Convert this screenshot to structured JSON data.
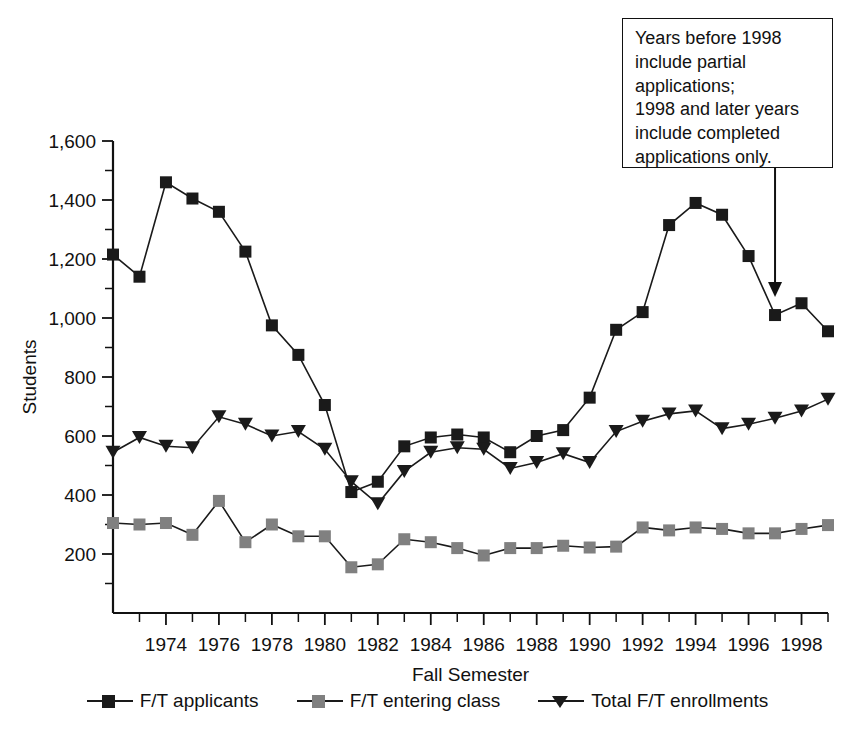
{
  "chart_data": {
    "type": "line",
    "title": "",
    "xlabel": "Fall Semester",
    "ylabel": "Students",
    "xlim": [
      1972,
      1999
    ],
    "ylim": [
      0,
      1600
    ],
    "ytick_values": [
      200,
      400,
      600,
      800,
      1000,
      1200,
      1400,
      1600
    ],
    "ytick_labels": [
      "200",
      "400",
      "600",
      "800",
      "1,000",
      "1,200",
      "1,400",
      "1,600"
    ],
    "yminor_step": 100,
    "xtick_values": [
      1974,
      1976,
      1978,
      1980,
      1982,
      1984,
      1986,
      1988,
      1990,
      1992,
      1994,
      1996,
      1998
    ],
    "xtick_labels": [
      "1974",
      "1976",
      "1978",
      "1980",
      "1982",
      "1984",
      "1986",
      "1988",
      "1990",
      "1992",
      "1994",
      "1996",
      "1998"
    ],
    "xminor_step": 1,
    "grid": false,
    "legend_position": "bottom",
    "x": [
      1972,
      1973,
      1974,
      1975,
      1976,
      1977,
      1978,
      1979,
      1980,
      1981,
      1982,
      1983,
      1984,
      1985,
      1986,
      1987,
      1988,
      1989,
      1990,
      1991,
      1992,
      1993,
      1994,
      1995,
      1996,
      1997,
      1998,
      1999
    ],
    "series": [
      {
        "name": "F/T applicants",
        "marker": "square",
        "color": "#1a1a1a",
        "values": [
          1215,
          1140,
          1460,
          1405,
          1360,
          1225,
          975,
          875,
          705,
          410,
          445,
          565,
          595,
          605,
          595,
          545,
          600,
          620,
          730,
          960,
          1020,
          1315,
          1390,
          1350,
          1210,
          1010,
          1050,
          955
        ]
      },
      {
        "name": "F/T entering class",
        "marker": "square",
        "color": "#808080",
        "values": [
          305,
          300,
          305,
          265,
          380,
          240,
          300,
          260,
          260,
          155,
          165,
          250,
          240,
          220,
          195,
          220,
          220,
          228,
          222,
          225,
          290,
          280,
          290,
          285,
          270,
          270,
          285,
          298
        ]
      },
      {
        "name": "Total F/T enrollments",
        "marker": "triangle",
        "color": "#1a1a1a",
        "values": [
          545,
          595,
          565,
          560,
          665,
          640,
          600,
          615,
          555,
          445,
          370,
          480,
          545,
          560,
          555,
          490,
          510,
          540,
          510,
          615,
          650,
          675,
          685,
          625,
          640,
          660,
          685,
          725
        ]
      }
    ]
  },
  "annotation": {
    "text": "Years before 1998\ninclude partial\napplications;\n1998 and later years\ninclude completed\napplications only.",
    "arrow_target_year": 1997
  },
  "legend": {
    "items": [
      {
        "label": "F/T applicants",
        "marker": "square",
        "color": "#1a1a1a"
      },
      {
        "label": "F/T entering class",
        "marker": "square",
        "color": "#808080"
      },
      {
        "label": "Total F/T enrollments",
        "marker": "triangle",
        "color": "#1a1a1a"
      }
    ]
  }
}
